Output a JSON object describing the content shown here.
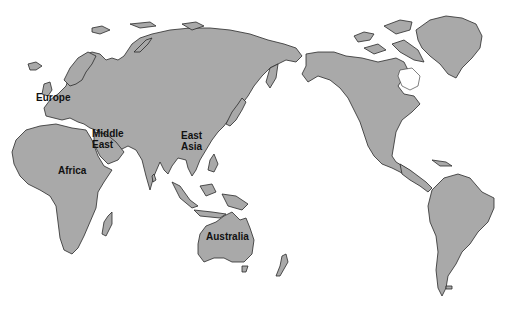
{
  "map": {
    "projection": "pacific-centered world map",
    "colors": {
      "land": "#a9a9a9",
      "ocean": "#ffffff",
      "outline": "#2a2a2a",
      "label": "#111111"
    },
    "labels": [
      {
        "id": "europe",
        "text": "Europe",
        "x": 60,
        "y": 97
      },
      {
        "id": "middle-east-1",
        "text": "Middle",
        "x": 92,
        "y": 133
      },
      {
        "id": "middle-east-2",
        "text": "East",
        "x": 92,
        "y": 144
      },
      {
        "id": "east-asia-1",
        "text": "East",
        "x": 181,
        "y": 135
      },
      {
        "id": "east-asia-2",
        "text": "Asia",
        "x": 181,
        "y": 146
      },
      {
        "id": "africa",
        "text": "Africa",
        "x": 58,
        "y": 165
      },
      {
        "id": "australia",
        "text": "Australia",
        "x": 206,
        "y": 231
      }
    ]
  }
}
